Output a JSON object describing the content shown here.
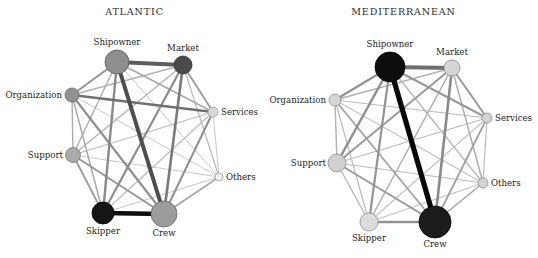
{
  "figure": {
    "type": "network-diagram-pair",
    "background_color": "#ffffff",
    "text_color": "#242424"
  },
  "chart_data": {
    "type": "network",
    "title": "",
    "node_labels": [
      "Shipowner",
      "Market",
      "Services",
      "Others",
      "Crew",
      "Skipper",
      "Support",
      "Organization"
    ],
    "panels": [
      {
        "title": "ATLANTIC",
        "nodes": [
          {
            "id": "shipowner",
            "label": "Shipowner",
            "x": 117,
            "y": 62,
            "r": 12.0,
            "color": "#8e8e8e",
            "stroke": "#5a5a5a",
            "label_pos": "top",
            "label_dx": 0,
            "label_dy": -15
          },
          {
            "id": "market",
            "label": "Market",
            "x": 183,
            "y": 65,
            "r": 9.0,
            "color": "#4a4a4a",
            "stroke": "#333333",
            "label_pos": "top",
            "label_dx": 0,
            "label_dy": -12
          },
          {
            "id": "services",
            "label": "Services",
            "x": 213,
            "y": 112,
            "r": 5.0,
            "color": "#d8d8d8",
            "stroke": "#9a9a9a",
            "label_pos": "right",
            "label_dx": 8,
            "label_dy": 0
          },
          {
            "id": "others",
            "label": "Others",
            "x": 219,
            "y": 177,
            "r": 4.0,
            "color": "#f0f0f0",
            "stroke": "#9a9a9a",
            "label_pos": "right",
            "label_dx": 7,
            "label_dy": 0
          },
          {
            "id": "crew",
            "label": "Crew",
            "x": 164,
            "y": 214,
            "r": 13.0,
            "color": "#9c9c9c",
            "stroke": "#6a6a6a",
            "label_pos": "bottom",
            "label_dx": 0,
            "label_dy": 15
          },
          {
            "id": "skipper",
            "label": "Skipper",
            "x": 103,
            "y": 213,
            "r": 11.0,
            "color": "#151515",
            "stroke": "#000000",
            "label_pos": "bottom",
            "label_dx": 0,
            "label_dy": 14
          },
          {
            "id": "support",
            "label": "Support",
            "x": 73,
            "y": 155,
            "r": 7.5,
            "color": "#aaaaaa",
            "stroke": "#7a7a7a",
            "label_pos": "left",
            "label_dx": -10,
            "label_dy": 0
          },
          {
            "id": "organization",
            "label": "Organization",
            "x": 72,
            "y": 95,
            "r": 7.0,
            "color": "#929292",
            "stroke": "#6a6a6a",
            "label_pos": "left",
            "label_dx": -10,
            "label_dy": 0
          }
        ],
        "edges": [
          {
            "s": "skipper",
            "t": "crew",
            "w": 4.6,
            "c": "#0d0d0d"
          },
          {
            "s": "shipowner",
            "t": "crew",
            "w": 4.0,
            "c": "#4d4d4d"
          },
          {
            "s": "shipowner",
            "t": "market",
            "w": 4.0,
            "c": "#5e5e5e"
          },
          {
            "s": "organization",
            "t": "services",
            "w": 2.7,
            "c": "#707070"
          },
          {
            "s": "market",
            "t": "crew",
            "w": 2.6,
            "c": "#7a7a7a"
          },
          {
            "s": "shipowner",
            "t": "skipper",
            "w": 2.4,
            "c": "#8a8a8a"
          },
          {
            "s": "organization",
            "t": "shipowner",
            "w": 2.0,
            "c": "#949494"
          },
          {
            "s": "market",
            "t": "skipper",
            "w": 2.2,
            "c": "#8c8c8c"
          },
          {
            "s": "support",
            "t": "crew",
            "w": 1.9,
            "c": "#969696"
          },
          {
            "s": "services",
            "t": "crew",
            "w": 2.0,
            "c": "#8f8f8f"
          },
          {
            "s": "others",
            "t": "crew",
            "w": 1.6,
            "c": "#a6a6a6"
          },
          {
            "s": "organization",
            "t": "crew",
            "w": 2.1,
            "c": "#8d8d8d"
          },
          {
            "s": "market",
            "t": "services",
            "w": 1.8,
            "c": "#9a9a9a"
          },
          {
            "s": "support",
            "t": "skipper",
            "w": 1.8,
            "c": "#9c9c9c"
          },
          {
            "s": "organization",
            "t": "skipper",
            "w": 1.5,
            "c": "#a8a8a8"
          },
          {
            "s": "shipowner",
            "t": "services",
            "w": 1.5,
            "c": "#a8a8a8"
          },
          {
            "s": "shipowner",
            "t": "support",
            "w": 1.4,
            "c": "#ababab"
          },
          {
            "s": "organization",
            "t": "support",
            "w": 1.4,
            "c": "#ababab"
          },
          {
            "s": "market",
            "t": "support",
            "w": 1.3,
            "c": "#b2b2b2"
          },
          {
            "s": "market",
            "t": "others",
            "w": 1.2,
            "c": "#b8b8b8"
          },
          {
            "s": "market",
            "t": "organization",
            "w": 1.3,
            "c": "#b2b2b2"
          },
          {
            "s": "services",
            "t": "support",
            "w": 1.2,
            "c": "#bcbcbc"
          },
          {
            "s": "services",
            "t": "skipper",
            "w": 1.2,
            "c": "#bcbcbc"
          },
          {
            "s": "services",
            "t": "others",
            "w": 1.0,
            "c": "#c6c6c6"
          },
          {
            "s": "others",
            "t": "skipper",
            "w": 1.0,
            "c": "#c6c6c6"
          },
          {
            "s": "others",
            "t": "support",
            "w": 1.0,
            "c": "#c9c9c9"
          },
          {
            "s": "others",
            "t": "organization",
            "w": 1.0,
            "c": "#c9c9c9"
          },
          {
            "s": "shipowner",
            "t": "others",
            "w": 1.0,
            "c": "#c6c6c6"
          }
        ]
      },
      {
        "title": "MEDITERRANEAN",
        "nodes": [
          {
            "id": "shipowner",
            "label": "Shipowner",
            "x": 121,
            "y": 67,
            "r": 15.0,
            "color": "#0d0d0d",
            "stroke": "#000000",
            "label_pos": "top",
            "label_dx": 0,
            "label_dy": -18
          },
          {
            "id": "market",
            "label": "Market",
            "x": 183,
            "y": 68,
            "r": 8.0,
            "color": "#d5d5d5",
            "stroke": "#8e8e8e",
            "label_pos": "top",
            "label_dx": 0,
            "label_dy": -11
          },
          {
            "id": "services",
            "label": "Services",
            "x": 218,
            "y": 118,
            "r": 5.0,
            "color": "#d2d2d2",
            "stroke": "#8e8e8e",
            "label_pos": "right",
            "label_dx": 8,
            "label_dy": 0
          },
          {
            "id": "others",
            "label": "Others",
            "x": 214,
            "y": 183,
            "r": 5.0,
            "color": "#d2d2d2",
            "stroke": "#8e8e8e",
            "label_pos": "right",
            "label_dx": 8,
            "label_dy": 0
          },
          {
            "id": "crew",
            "label": "Crew",
            "x": 166,
            "y": 222,
            "r": 16.0,
            "color": "#1c1c1c",
            "stroke": "#000000",
            "label_pos": "bottom",
            "label_dx": 0,
            "label_dy": 18
          },
          {
            "id": "skipper",
            "label": "Skipper",
            "x": 100,
            "y": 222,
            "r": 9.0,
            "color": "#dcdcdc",
            "stroke": "#8e8e8e",
            "label_pos": "bottom",
            "label_dx": 0,
            "label_dy": 12
          },
          {
            "id": "support",
            "label": "Support",
            "x": 68,
            "y": 163,
            "r": 9.0,
            "color": "#d0d0d0",
            "stroke": "#8e8e8e",
            "label_pos": "left",
            "label_dx": -11,
            "label_dy": 0
          },
          {
            "id": "organization",
            "label": "Organization",
            "x": 66,
            "y": 100,
            "r": 6.0,
            "color": "#d6d6d6",
            "stroke": "#8e8e8e",
            "label_pos": "left",
            "label_dx": -9,
            "label_dy": 0
          }
        ],
        "edges": [
          {
            "s": "shipowner",
            "t": "crew",
            "w": 5.2,
            "c": "#080808"
          },
          {
            "s": "shipowner",
            "t": "market",
            "w": 4.2,
            "c": "#6e6e6e"
          },
          {
            "s": "market",
            "t": "crew",
            "w": 2.6,
            "c": "#8a8a8a"
          },
          {
            "s": "skipper",
            "t": "crew",
            "w": 2.4,
            "c": "#949494"
          },
          {
            "s": "shipowner",
            "t": "support",
            "w": 2.4,
            "c": "#8e8e8e"
          },
          {
            "s": "shipowner",
            "t": "skipper",
            "w": 2.2,
            "c": "#949494"
          },
          {
            "s": "shipowner",
            "t": "organization",
            "w": 2.2,
            "c": "#929292"
          },
          {
            "s": "market",
            "t": "services",
            "w": 2.0,
            "c": "#9a9a9a"
          },
          {
            "s": "shipowner",
            "t": "services",
            "w": 2.0,
            "c": "#9a9a9a"
          },
          {
            "s": "market",
            "t": "support",
            "w": 2.0,
            "c": "#9a9a9a"
          },
          {
            "s": "support",
            "t": "crew",
            "w": 2.0,
            "c": "#9a9a9a"
          },
          {
            "s": "organization",
            "t": "crew",
            "w": 1.8,
            "c": "#a2a2a2"
          },
          {
            "s": "services",
            "t": "crew",
            "w": 1.8,
            "c": "#a2a2a2"
          },
          {
            "s": "others",
            "t": "crew",
            "w": 1.6,
            "c": "#a8a8a8"
          },
          {
            "s": "market",
            "t": "skipper",
            "w": 1.5,
            "c": "#aeaeae"
          },
          {
            "s": "market",
            "t": "organization",
            "w": 1.4,
            "c": "#b2b2b2"
          },
          {
            "s": "market",
            "t": "others",
            "w": 1.5,
            "c": "#aeaeae"
          },
          {
            "s": "organization",
            "t": "support",
            "w": 1.4,
            "c": "#b2b2b2"
          },
          {
            "s": "organization",
            "t": "services",
            "w": 1.2,
            "c": "#bcbcbc"
          },
          {
            "s": "organization",
            "t": "skipper",
            "w": 1.2,
            "c": "#bcbcbc"
          },
          {
            "s": "organization",
            "t": "others",
            "w": 1.1,
            "c": "#c2c2c2"
          },
          {
            "s": "support",
            "t": "services",
            "w": 1.2,
            "c": "#bcbcbc"
          },
          {
            "s": "support",
            "t": "skipper",
            "w": 1.3,
            "c": "#b8b8b8"
          },
          {
            "s": "support",
            "t": "others",
            "w": 1.2,
            "c": "#bcbcbc"
          },
          {
            "s": "services",
            "t": "others",
            "w": 1.2,
            "c": "#bcbcbc"
          },
          {
            "s": "services",
            "t": "skipper",
            "w": 1.1,
            "c": "#c2c2c2"
          },
          {
            "s": "others",
            "t": "skipper",
            "w": 1.1,
            "c": "#c2c2c2"
          },
          {
            "s": "shipowner",
            "t": "others",
            "w": 1.3,
            "c": "#b8b8b8"
          }
        ]
      }
    ]
  }
}
